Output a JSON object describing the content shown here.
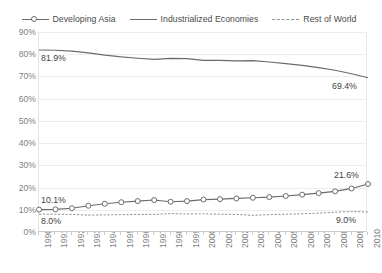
{
  "legend": {
    "position": "top-center",
    "items": [
      {
        "label": "Developing Asia",
        "style": "line-marker",
        "color": "#6b6b6b",
        "marker": "hollow-circle"
      },
      {
        "label": "Industrialized Economies",
        "style": "line",
        "color": "#6b6b6b",
        "marker": "none"
      },
      {
        "label": "Rest of World",
        "style": "dashed",
        "color": "#8f8f8f",
        "marker": "none"
      }
    ]
  },
  "chart_data": {
    "type": "line",
    "title": "",
    "subtitle": "",
    "xlabel": "",
    "ylabel": "",
    "grid": true,
    "legend_position": "top-center",
    "x": [
      1990,
      1991,
      1992,
      1993,
      1994,
      1995,
      1996,
      1997,
      1998,
      1999,
      2000,
      2001,
      2002,
      2003,
      2004,
      2005,
      2006,
      2007,
      2008,
      2009,
      2010
    ],
    "xlim": [
      1990,
      2010
    ],
    "ylim": [
      0,
      90
    ],
    "ytick_labels": [
      "0%",
      "10%",
      "20%",
      "30%",
      "40%",
      "50%",
      "60%",
      "70%",
      "80%",
      "90%"
    ],
    "ytick_values": [
      0,
      10,
      20,
      30,
      40,
      50,
      60,
      70,
      80,
      90
    ],
    "xtick_labels": [
      "1990",
      "1991",
      "1992",
      "1993",
      "1994",
      "1995",
      "1996",
      "1997",
      "1998",
      "1999",
      "2000",
      "2001",
      "2002",
      "2003",
      "2004",
      "2005",
      "2006",
      "2007",
      "2008",
      "2009",
      "2010"
    ],
    "series": [
      {
        "name": "Developing Asia",
        "marker": "hollow-circle",
        "dash": false,
        "color": "#6b6b6b",
        "values": [
          10.1,
          10.2,
          10.7,
          11.8,
          12.7,
          13.4,
          13.9,
          14.4,
          13.6,
          13.9,
          14.6,
          14.8,
          15.1,
          15.4,
          15.7,
          16.2,
          16.8,
          17.5,
          18.3,
          19.6,
          21.6
        ]
      },
      {
        "name": "Industrialized Economies",
        "marker": "none",
        "dash": false,
        "color": "#6b6b6b",
        "values": [
          81.9,
          81.8,
          81.4,
          80.6,
          79.6,
          78.8,
          78.2,
          77.7,
          78.1,
          78.0,
          77.2,
          77.2,
          77.0,
          77.1,
          76.5,
          75.8,
          75.0,
          74.0,
          72.8,
          71.2,
          69.4
        ]
      },
      {
        "name": "Rest of World",
        "marker": "none",
        "dash": true,
        "color": "#8f8f8f",
        "values": [
          8.0,
          8.0,
          7.9,
          7.6,
          7.7,
          7.8,
          7.9,
          7.9,
          8.3,
          8.1,
          8.2,
          8.0,
          7.9,
          7.5,
          7.8,
          8.0,
          8.2,
          8.5,
          8.9,
          9.2,
          9.0
        ]
      }
    ],
    "annotations": [
      {
        "text": "81.9%",
        "series": "Industrialized Economies",
        "x": 1990,
        "y": 81.9
      },
      {
        "text": "69.4%",
        "series": "Industrialized Economies",
        "x": 2010,
        "y": 69.4
      },
      {
        "text": "10.1%",
        "series": "Developing Asia",
        "x": 1990,
        "y": 10.1
      },
      {
        "text": "21.6%",
        "series": "Developing Asia",
        "x": 2010,
        "y": 21.6
      },
      {
        "text": "8.0%",
        "series": "Rest of World",
        "x": 1990,
        "y": 8.0
      },
      {
        "text": "9.0%",
        "series": "Rest of World",
        "x": 2010,
        "y": 9.0
      }
    ]
  }
}
